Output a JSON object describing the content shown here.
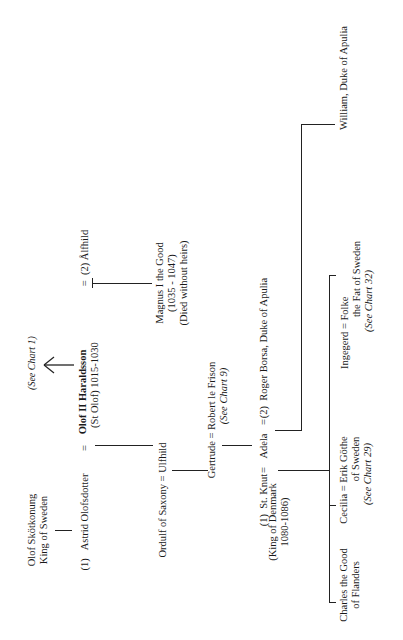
{
  "chart": {
    "orientation": "rotated -90deg (reads bottom-to-top)",
    "people": {
      "olof_skotkonung": {
        "name": "Olof Skötkonung",
        "title": "King of Sweden"
      },
      "astrid": {
        "prefix": "(1)",
        "name": "Astrid Olofsdotter"
      },
      "olof_ii": {
        "name": "Olof II  Haraldsson",
        "subtitle": "(St Olof) 1015-1030"
      },
      "see_chart_1": "(See Chart 1)",
      "alfhild": {
        "prefix": "(2)",
        "name": "Ålfhild"
      },
      "magnus": {
        "name": "Magnus I  the Good",
        "dates": "(1035 - 1047)",
        "note": "(Died without heirs)"
      },
      "ordulf_ulfhild": {
        "text": "Ordulf of Saxony = Ulfhild"
      },
      "gertrude_robert": {
        "text": "Gertrude = Robert le Frison",
        "ref": "(See  Chart 9)"
      },
      "st_knut": {
        "prefix": "(1)",
        "name": "St. Knut",
        "title": "(King of Denmark",
        "dates": "1080-1086)"
      },
      "adela": {
        "name": "Adela"
      },
      "roger_borsa": {
        "prefix": "(2)",
        "name": "Roger Borsa, Duke of Apulia"
      },
      "charles": {
        "line1": "Charles the Good",
        "line2": "of Flanders"
      },
      "cecilia": {
        "line1": "Cecilia = Erik Göthe",
        "line2": "of Sweden",
        "ref": "(See  Chart 29)"
      },
      "ingegerd": {
        "line1": "Ingegerd  =  Folke",
        "line2": "the Fat of Sweden",
        "ref": "(See  Chart 32)"
      },
      "william": {
        "name": "William, Duke of Apulia"
      }
    },
    "symbols": {
      "equals": "="
    },
    "line_color": "#222222",
    "background": "#ffffff"
  }
}
